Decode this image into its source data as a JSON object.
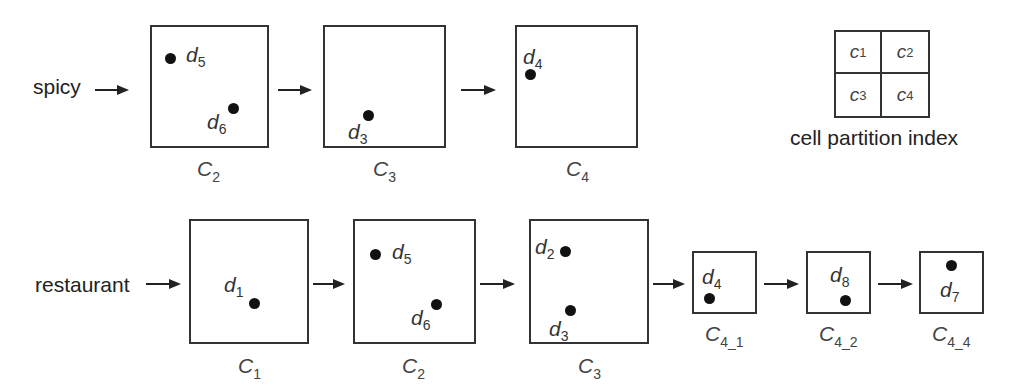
{
  "figure": {
    "rows": [
      {
        "term": "spicy",
        "cells": [
          {
            "id": "C",
            "sub": "2",
            "points": [
              {
                "name": "d",
                "sub": "5"
              },
              {
                "name": "d",
                "sub": "6"
              }
            ]
          },
          {
            "id": "C",
            "sub": "3",
            "points": [
              {
                "name": "d",
                "sub": "3"
              }
            ]
          },
          {
            "id": "C",
            "sub": "4",
            "points": [
              {
                "name": "d",
                "sub": "4"
              }
            ]
          }
        ]
      },
      {
        "term": "restaurant",
        "cells": [
          {
            "id": "C",
            "sub": "1",
            "points": [
              {
                "name": "d",
                "sub": "1"
              }
            ]
          },
          {
            "id": "C",
            "sub": "2",
            "points": [
              {
                "name": "d",
                "sub": "5"
              },
              {
                "name": "d",
                "sub": "6"
              }
            ]
          },
          {
            "id": "C",
            "sub": "3",
            "points": [
              {
                "name": "d",
                "sub": "2"
              },
              {
                "name": "d",
                "sub": "3"
              }
            ]
          },
          {
            "id": "C",
            "sub": "4_1",
            "points": [
              {
                "name": "d",
                "sub": "4"
              }
            ]
          },
          {
            "id": "C",
            "sub": "4_2",
            "points": [
              {
                "name": "d",
                "sub": "8"
              }
            ]
          },
          {
            "id": "C",
            "sub": "4_4",
            "points": [
              {
                "name": "d",
                "sub": "7"
              }
            ]
          }
        ]
      }
    ],
    "legend": {
      "cells": [
        {
          "name": "c",
          "sub": "1"
        },
        {
          "name": "c",
          "sub": "2"
        },
        {
          "name": "c",
          "sub": "3"
        },
        {
          "name": "c",
          "sub": "4"
        }
      ],
      "caption": "cell partition index"
    }
  }
}
